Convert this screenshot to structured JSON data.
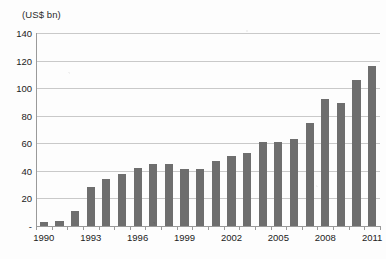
{
  "chart_data": {
    "type": "bar",
    "title": "",
    "subtitle": "",
    "unit_caption": "(US$ bn)",
    "xlabel": "",
    "ylabel": "",
    "ylim": [
      0,
      140
    ],
    "y_ticks": [
      0,
      20,
      40,
      60,
      80,
      100,
      120,
      140
    ],
    "y_tick_labels": [
      "-",
      "20",
      "40",
      "60",
      "80",
      "100",
      "120",
      "140"
    ],
    "x_tick_labels": [
      "1990",
      "1993",
      "1996",
      "1999",
      "2002",
      "2005",
      "2008",
      "2011"
    ],
    "grid": true,
    "legend": "none",
    "bar_color": "#6e6e6e",
    "categories": [
      "1990",
      "1991",
      "1992",
      "1993",
      "1994",
      "1995",
      "1996",
      "1997",
      "1998",
      "1999",
      "2000",
      "2001",
      "2002",
      "2003",
      "2004",
      "2005",
      "2006",
      "2007",
      "2008",
      "2009",
      "2010",
      "2011"
    ],
    "values": [
      3,
      3.5,
      11,
      28,
      34,
      38,
      42,
      45,
      45,
      41,
      41,
      47,
      51,
      53,
      61,
      61,
      63,
      75,
      92,
      89,
      106,
      116
    ]
  }
}
